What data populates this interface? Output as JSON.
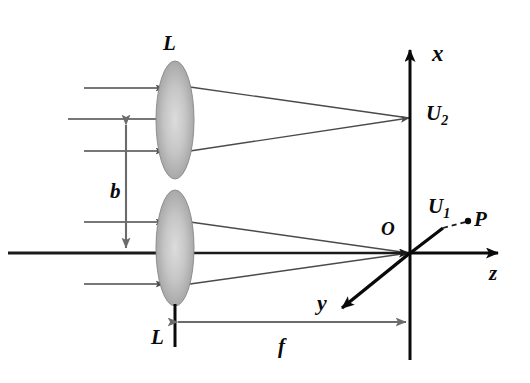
{
  "figure": {
    "colors": {
      "ray": "#4a4a4a",
      "axis": "#0a0a0a",
      "lens_fill_outer": "#9b9b9b",
      "lens_fill_inner": "#d2d2d2",
      "dimension": "#6b6b6b",
      "label": "#0a0a0a"
    },
    "labels": {
      "lens_upper": "L",
      "lens_lower": "L",
      "separation": "b",
      "focal_length": "f",
      "axis_x": "x",
      "axis_y": "y",
      "axis_z": "z",
      "origin": "O",
      "point_p": "P",
      "field_u1_main": "U",
      "field_u1_sub": "1",
      "field_u2_main": "U",
      "field_u2_sub": "2"
    },
    "elements": {
      "lens_count": 2,
      "incoming_rays_upper": 3,
      "incoming_rays_lower": 3,
      "converging_rays_upper": 2,
      "converging_rays_lower": 3,
      "dashed_connector": "U1-to-P",
      "optical_axis": "horizontal-thick-line"
    }
  }
}
